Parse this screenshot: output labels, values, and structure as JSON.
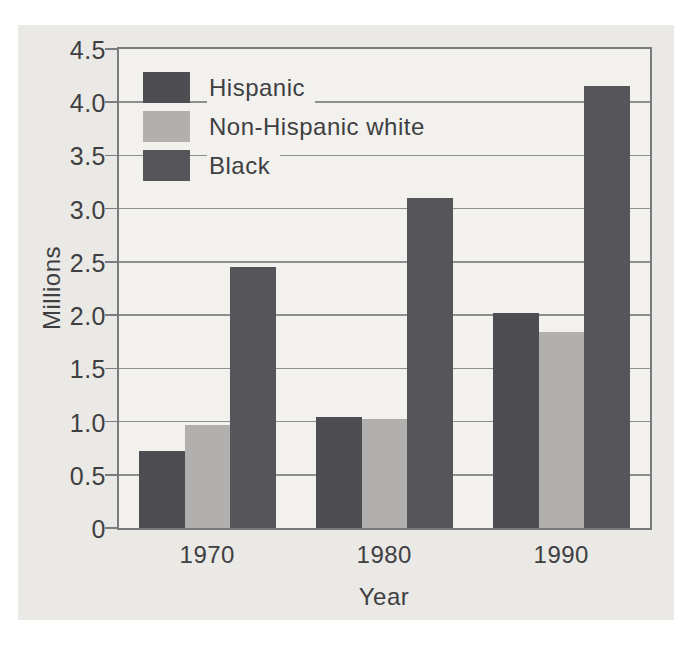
{
  "window": {
    "width": 685,
    "height": 647
  },
  "colors": {
    "page_bg": "#ffffff",
    "panel_bg": "#eae9e5",
    "plot_bg": "#f2f1ee",
    "frame": "#7a7a7f",
    "gridline": "#8e8e91",
    "text": "#3f3f42"
  },
  "chart_data": {
    "type": "bar",
    "title": "",
    "xlabel": "Year",
    "ylabel": "Millions",
    "categories": [
      "1970",
      "1980",
      "1990"
    ],
    "series": [
      {
        "name": "Hispanic",
        "color": "#4d4d52",
        "values": [
          0.72,
          1.04,
          2.02
        ]
      },
      {
        "name": "Non-Hispanic white",
        "color": "#b1b0ae",
        "values": [
          0.97,
          1.02,
          1.84
        ]
      },
      {
        "name": "Black",
        "color": "#55555a",
        "values": [
          2.45,
          3.1,
          4.15
        ]
      }
    ],
    "ylim": [
      0,
      4.5
    ],
    "ytick_step": 0.5,
    "ytick_labels": [
      "0",
      "0.5",
      "1.0",
      "1.5",
      "2.0",
      "2.5",
      "3.0",
      "3.5",
      "4.0",
      "4.5"
    ],
    "grid": true,
    "legend_position": "upper-left"
  }
}
